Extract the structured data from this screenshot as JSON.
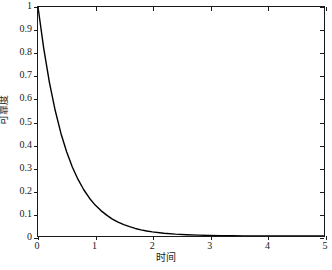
{
  "chart_data": {
    "type": "line",
    "title": "",
    "xlabel": "时间",
    "ylabel": "可靠度",
    "xlim": [
      0,
      5
    ],
    "ylim": [
      0,
      1
    ],
    "grid": false,
    "legend": null,
    "xticks": [
      "0",
      "1",
      "2",
      "3",
      "4",
      "5"
    ],
    "xtick_values": [
      0,
      1,
      2,
      3,
      4,
      5
    ],
    "yticks": [
      "0",
      "0.1",
      "0.2",
      "0.3",
      "0.4",
      "0.5",
      "0.6",
      "0.7",
      "0.8",
      "0.9",
      "1"
    ],
    "ytick_values": [
      0,
      0.1,
      0.2,
      0.3,
      0.4,
      0.5,
      0.6,
      0.7,
      0.8,
      0.9,
      1
    ],
    "series": [
      {
        "name": "可靠度 R(t)",
        "color": "#000000",
        "line_width": 1.4,
        "x": [
          0,
          0.1,
          0.2,
          0.3,
          0.4,
          0.5,
          0.6,
          0.7,
          0.8,
          0.9,
          1.0,
          1.1,
          1.2,
          1.3,
          1.4,
          1.5,
          1.6,
          1.7,
          1.8,
          1.9,
          2.0,
          2.2,
          2.4,
          2.6,
          2.8,
          3.0,
          3.2,
          3.4,
          3.6,
          3.8,
          4.0,
          4.2,
          4.4,
          4.6,
          4.8,
          5.0
        ],
        "values": [
          1.0,
          0.819,
          0.67,
          0.549,
          0.449,
          0.368,
          0.301,
          0.247,
          0.202,
          0.165,
          0.135,
          0.111,
          0.091,
          0.074,
          0.061,
          0.05,
          0.041,
          0.033,
          0.027,
          0.022,
          0.018,
          0.012,
          0.008,
          0.0055,
          0.0037,
          0.0025,
          0.0017,
          0.0011,
          0.00075,
          0.0005,
          0.00034,
          0.00022,
          0.00015,
          0.0001,
          7e-05,
          5e-05
        ]
      }
    ]
  },
  "axes": {
    "x_axis_name": "时间",
    "y_axis_name": "可靠度"
  },
  "colors": {
    "curve": "#000000",
    "axis": "#1a1a1a",
    "background": "#ffffff"
  }
}
